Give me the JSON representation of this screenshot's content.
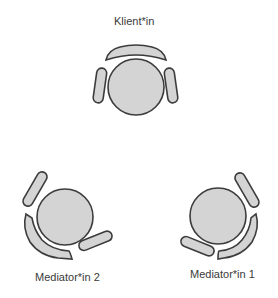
{
  "diagram": {
    "type": "seating-arrangement",
    "colors": {
      "fill": "#d4d4d4",
      "stroke": "#3c3c3c",
      "text": "#3a3a3a",
      "background": "#ffffff"
    },
    "positions": [
      {
        "id": "client",
        "label": "Klient*in"
      },
      {
        "id": "mediator2",
        "label": "Mediator*in 2"
      },
      {
        "id": "mediator1",
        "label": "Mediator*in 1"
      }
    ]
  }
}
